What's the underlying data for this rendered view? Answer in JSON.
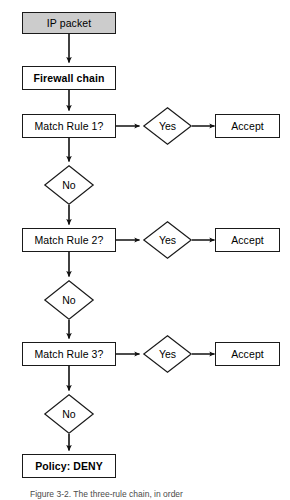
{
  "figure": {
    "caption": "Figure 3-2.  The three-rule chain, in order",
    "background_color": "#ffffff",
    "stroke_color": "#1a1a1a",
    "shaded_fill": "#cccccc"
  },
  "nodes": {
    "start": {
      "label": "IP packet",
      "shape": "rectangle",
      "fill": "#cccccc",
      "bold": false
    },
    "chain": {
      "label": "Firewall chain",
      "shape": "rectangle",
      "fill": "#ffffff",
      "bold": true
    },
    "policy": {
      "label": "Policy: DENY",
      "shape": "rectangle",
      "fill": "#ffffff",
      "bold": true
    }
  },
  "rules": [
    {
      "question": "Match Rule 1?",
      "yes_label": "Yes",
      "no_label": "No",
      "accept_label": "Accept"
    },
    {
      "question": "Match Rule 2?",
      "yes_label": "Yes",
      "no_label": "No",
      "accept_label": "Accept"
    },
    {
      "question": "Match Rule 3?",
      "yes_label": "Yes",
      "no_label": "No",
      "accept_label": "Accept"
    }
  ]
}
